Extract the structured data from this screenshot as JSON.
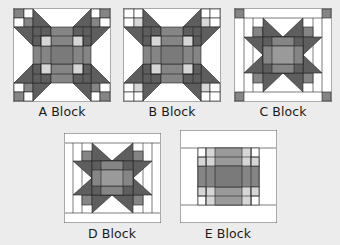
{
  "colors": {
    "background": "#ececec",
    "white": "#ffffff",
    "light": "#d6d6d6",
    "mid": "#9a9a9a",
    "medium": "#858585",
    "dark": "#5e5e5e",
    "line": "#222222",
    "border": "#6f6f6f"
  },
  "blocks": [
    {
      "id": "A",
      "label": "A Block"
    },
    {
      "id": "B",
      "label": "B Block"
    },
    {
      "id": "C",
      "label": "C Block"
    },
    {
      "id": "D",
      "label": "D Block"
    },
    {
      "id": "E",
      "label": "E Block"
    }
  ]
}
